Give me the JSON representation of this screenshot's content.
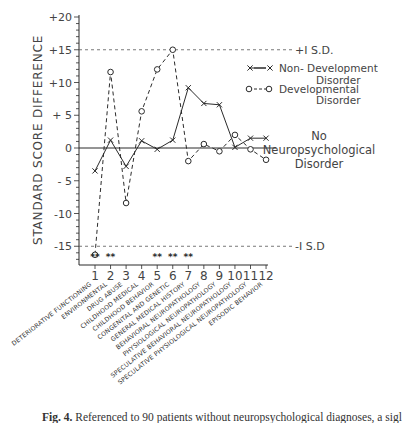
{
  "chart_data": {
    "type": "line",
    "title": "",
    "ylabel": "STANDARD SCORE DIFFERENCE",
    "xlabel": "",
    "ylim": [
      -18,
      21
    ],
    "yticks": [
      20,
      15,
      10,
      5,
      0,
      -5,
      -10,
      -15
    ],
    "ytick_labels": [
      "+20",
      "+15",
      "+10",
      "+ 5",
      "0",
      "- 5",
      "-10",
      "-15"
    ],
    "x": [
      1,
      2,
      3,
      4,
      5,
      6,
      7,
      8,
      9,
      10,
      11,
      12
    ],
    "categories": [
      "DETERIORATIVE FUNCTIONING",
      "ENVIRONMENTAL",
      "DRUG ABUSE",
      "CHILDHOOD MEDICAL",
      "CHILDHOOD BEHAVIOR",
      "CONGENITAL AND GENETIC",
      "GENERAL MEDICAL HISTORY",
      "BEHAVIORAL NEUROPATHOLOGY",
      "PHYSIOLOGICAL NEUROPATHOLOGY",
      "SPECULATIVE BEHAVIORAL NEUROPATHOLOGY",
      "SPECULATIVE PHYSIOLOGICAL NEUROPATHOLOGY",
      "EPISODIC BEHAVIOR"
    ],
    "series": [
      {
        "name": "Non-Developmental Disorder",
        "marker": "x",
        "line": "solid",
        "values": [
          -3.5,
          1.2,
          -2.8,
          1.1,
          -0.2,
          1.2,
          9.2,
          6.8,
          6.6,
          0.1,
          1.5,
          1.5
        ]
      },
      {
        "name": "Developmental Disorder",
        "marker": "o",
        "line": "dashed",
        "values": [
          -16.3,
          11.6,
          -8.4,
          5.6,
          12.0,
          15.0,
          -2.0,
          0.6,
          -0.5,
          2.0,
          -0.2,
          -1.8
        ]
      }
    ],
    "reference_lines": [
      {
        "y": 15,
        "label": "+I S.D.",
        "style": "dashed"
      },
      {
        "y": -15,
        "label": "-I S.D",
        "style": "dashed"
      },
      {
        "y": 0,
        "label": "No Neuropsychological Disorder",
        "style": "solid"
      }
    ],
    "significance_markers": [
      {
        "x": 1,
        "label": "**"
      },
      {
        "x": 2,
        "label": "**"
      },
      {
        "x": 5,
        "label": "**"
      },
      {
        "x": 6,
        "label": "**"
      },
      {
        "x": 7,
        "label": "**"
      }
    ],
    "legend": {
      "position": "upper right",
      "entries": [
        {
          "line1": "Non- Developmental",
          "line2": "Disorder",
          "sample": "x—x"
        },
        {
          "line1": "Developmental",
          "line2": "Disorder",
          "sample": "o---o"
        }
      ]
    },
    "zero_label": [
      "No",
      "Neuropsychological",
      "Disorder"
    ],
    "grid": false
  },
  "caption": {
    "prefix": "Fig. 4.",
    "text": "Referenced to 90 patients without neuropsychological diagnoses, a sigl"
  }
}
